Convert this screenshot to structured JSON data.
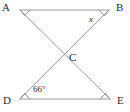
{
  "figure": {
    "type": "geometry-diagram",
    "background_color": "#ffffff",
    "line_color": "#9a9a9a",
    "text_color": "#2b2b2b",
    "vertices": [
      {
        "id": "A",
        "label": "A",
        "x": 20,
        "y": 10
      },
      {
        "id": "B",
        "label": "B",
        "x": 109,
        "y": 10
      },
      {
        "id": "C",
        "label": "C",
        "x": 64,
        "y": 58
      },
      {
        "id": "D",
        "label": "D",
        "x": 20,
        "y": 99
      },
      {
        "id": "E",
        "label": "E",
        "x": 110,
        "y": 99
      }
    ],
    "segments": [
      {
        "id": "AB",
        "from": "A",
        "to": "B"
      },
      {
        "id": "DE",
        "from": "D",
        "to": "E"
      },
      {
        "id": "AE",
        "from": "A",
        "to": "E"
      },
      {
        "id": "BD",
        "from": "B",
        "to": "D"
      }
    ],
    "angle_marks": [
      {
        "at": "A",
        "label": "",
        "marked": true
      },
      {
        "at": "B",
        "label": "x",
        "marked": true
      },
      {
        "at": "D",
        "label": "66°",
        "marked": true
      },
      {
        "at": "E",
        "label": "",
        "marked": true
      }
    ],
    "labels": {
      "A": "A",
      "B": "B",
      "C": "C",
      "D": "D",
      "E": "E",
      "unknown_angle": "x",
      "known_angle": "66°"
    }
  }
}
